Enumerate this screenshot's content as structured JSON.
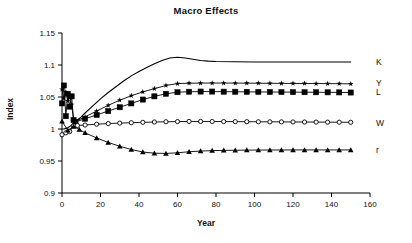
{
  "chart_data": {
    "type": "line",
    "title": "Macro Effects",
    "xlabel": "Year",
    "ylabel": "Index",
    "xlim": [
      0,
      160
    ],
    "ylim": [
      0.9,
      1.15
    ],
    "xticks": [
      0,
      20,
      40,
      60,
      80,
      100,
      120,
      140,
      160
    ],
    "yticks": [
      0.9,
      0.95,
      1,
      1.05,
      1.1,
      1.15
    ],
    "xtick_labels": [
      "0",
      "20",
      "40",
      "60",
      "80",
      "100",
      "120",
      "140",
      "160"
    ],
    "ytick_labels": [
      "0.9",
      "0.95",
      "1",
      "1.05",
      "1.1",
      "1.15"
    ],
    "grid": false,
    "legend_position": "right-of-plot-inline",
    "series": [
      {
        "name": "K",
        "marker": "none",
        "label_y": 1.105,
        "color": "#000000",
        "x": [
          0,
          1,
          2,
          3,
          4,
          5,
          6,
          8,
          10,
          12,
          16,
          20,
          24,
          28,
          32,
          36,
          40,
          44,
          48,
          52,
          56,
          60,
          64,
          68,
          72,
          76,
          80,
          90,
          100,
          110,
          120,
          130,
          140,
          150
        ],
        "y": [
          1.0,
          1.0,
          1.001,
          1.002,
          1.004,
          1.006,
          1.009,
          1.014,
          1.019,
          1.025,
          1.036,
          1.047,
          1.057,
          1.066,
          1.075,
          1.083,
          1.09,
          1.096,
          1.102,
          1.107,
          1.111,
          1.112,
          1.111,
          1.109,
          1.107,
          1.106,
          1.1055,
          1.105,
          1.1048,
          1.1047,
          1.1046,
          1.1046,
          1.1046,
          1.1046
        ]
      },
      {
        "name": "Y",
        "marker": "star",
        "label_y": 1.072,
        "color": "#000000",
        "x": [
          0,
          1,
          2,
          3,
          4,
          5,
          6,
          7,
          12,
          18,
          24,
          30,
          36,
          42,
          48,
          54,
          60,
          66,
          72,
          78,
          84,
          90,
          96,
          102,
          108,
          114,
          120,
          126,
          132,
          138,
          144,
          150
        ],
        "y": [
          1.062,
          1.048,
          1.058,
          1.044,
          1.052,
          1.038,
          1.015,
          1.012,
          1.019,
          1.028,
          1.037,
          1.045,
          1.052,
          1.058,
          1.063,
          1.068,
          1.071,
          1.0715,
          1.0718,
          1.0718,
          1.0718,
          1.0717,
          1.0716,
          1.0715,
          1.0714,
          1.0713,
          1.0712,
          1.0711,
          1.071,
          1.0709,
          1.0708,
          1.0705
        ]
      },
      {
        "name": "L",
        "marker": "square",
        "label_y": 1.058,
        "color": "#000000",
        "x": [
          0,
          1,
          2,
          3,
          4,
          5,
          6,
          7,
          12,
          18,
          24,
          30,
          36,
          42,
          48,
          54,
          60,
          66,
          72,
          78,
          84,
          90,
          96,
          102,
          108,
          114,
          120,
          126,
          132,
          138,
          144,
          150
        ],
        "y": [
          1.04,
          1.068,
          1.02,
          1.055,
          1.035,
          1.051,
          1.014,
          1.011,
          1.016,
          1.022,
          1.028,
          1.034,
          1.04,
          1.046,
          1.051,
          1.055,
          1.0575,
          1.0582,
          1.0585,
          1.0585,
          1.0583,
          1.0582,
          1.058,
          1.0579,
          1.0578,
          1.0577,
          1.0576,
          1.0575,
          1.0574,
          1.0573,
          1.0572,
          1.057
        ]
      },
      {
        "name": "W",
        "marker": "circle",
        "label_y": 1.01,
        "color": "#000000",
        "x": [
          0,
          2,
          4,
          6,
          8,
          12,
          18,
          24,
          30,
          36,
          42,
          48,
          54,
          60,
          66,
          72,
          78,
          84,
          90,
          96,
          102,
          108,
          114,
          120,
          126,
          132,
          138,
          144,
          150
        ],
        "y": [
          0.991,
          0.994,
          0.996,
          1.005,
          1.0055,
          1.0062,
          1.0075,
          1.0085,
          1.0092,
          1.0098,
          1.0104,
          1.0109,
          1.0113,
          1.0116,
          1.0118,
          1.0118,
          1.0117,
          1.0116,
          1.0115,
          1.0114,
          1.0113,
          1.0112,
          1.0111,
          1.011,
          1.0109,
          1.0108,
          1.0107,
          1.0106,
          1.0105
        ]
      },
      {
        "name": "r",
        "marker": "triangle",
        "label_y": 0.967,
        "color": "#000000",
        "x": [
          0,
          3,
          6,
          9,
          12,
          18,
          24,
          30,
          36,
          42,
          48,
          54,
          60,
          66,
          72,
          78,
          84,
          90,
          96,
          102,
          108,
          114,
          120,
          126,
          132,
          138,
          144,
          150
        ],
        "y": [
          1.012,
          0.998,
          1.004,
          0.999,
          0.994,
          0.986,
          0.979,
          0.973,
          0.968,
          0.964,
          0.9622,
          0.9618,
          0.9628,
          0.9645,
          0.9655,
          0.9662,
          0.9666,
          0.9668,
          0.967,
          0.9671,
          0.9672,
          0.9672,
          0.9673,
          0.9673,
          0.9673,
          0.9673,
          0.9673,
          0.9673
        ]
      }
    ]
  }
}
